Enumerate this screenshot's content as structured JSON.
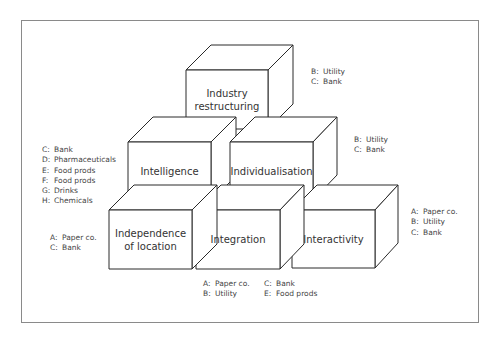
{
  "diagram": {
    "type": "pyramid-of-cubes",
    "cubes": [
      {
        "id": "industry-restructuring",
        "label_lines": [
          "Industry",
          "restructuring"
        ],
        "level": 3
      },
      {
        "id": "intelligence",
        "label_lines": [
          "Intelligence"
        ],
        "level": 2
      },
      {
        "id": "individualisation",
        "label_lines": [
          "Individualisation"
        ],
        "level": 2
      },
      {
        "id": "independence-of-location",
        "label_lines": [
          "Independence",
          "of location"
        ],
        "level": 1
      },
      {
        "id": "integration",
        "label_lines": [
          "Integration"
        ],
        "level": 1
      },
      {
        "id": "interactivity",
        "label_lines": [
          "Interactivity"
        ],
        "level": 1
      }
    ],
    "notes": {
      "industry_restructuring": [
        {
          "key": "B:",
          "value": "Utility"
        },
        {
          "key": "C:",
          "value": "Bank"
        }
      ],
      "individualisation": [
        {
          "key": "B:",
          "value": "Utility"
        },
        {
          "key": "C:",
          "value": "Bank"
        }
      ],
      "intelligence": [
        {
          "key": "C:",
          "value": "Bank"
        },
        {
          "key": "D:",
          "value": "Pharmaceuticals"
        },
        {
          "key": "E:",
          "value": "Food prods"
        },
        {
          "key": "F:",
          "value": "Food prods"
        },
        {
          "key": "G:",
          "value": "Drinks"
        },
        {
          "key": "H:",
          "value": "Chemicals"
        }
      ],
      "independence_of_location": [
        {
          "key": "A:",
          "value": "Paper co."
        },
        {
          "key": "C:",
          "value": "Bank"
        }
      ],
      "integration_col1": [
        {
          "key": "A:",
          "value": "Paper co."
        },
        {
          "key": "B:",
          "value": "Utility"
        }
      ],
      "integration_col2": [
        {
          "key": "C:",
          "value": "Bank"
        },
        {
          "key": "E:",
          "value": "Food prods"
        }
      ],
      "interactivity": [
        {
          "key": "A:",
          "value": "Paper co."
        },
        {
          "key": "B:",
          "value": "Utility"
        },
        {
          "key": "C:",
          "value": "Bank"
        }
      ]
    },
    "colors": {
      "line": "#2a2a2a",
      "frame": "#8a8a8a",
      "text": "#333333",
      "background": "#ffffff"
    }
  }
}
